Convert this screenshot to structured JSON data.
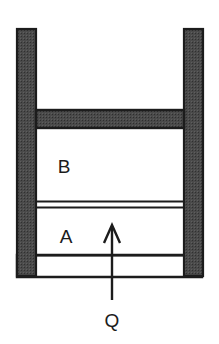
{
  "figure": {
    "background_color": "#ffffff",
    "wall_fill_color": "#4a4a4a",
    "wall_stroke_color": "#1c1c1c",
    "line_color": "#1c1c1c",
    "chamber_fill_color": "#ffffff"
  },
  "labels": {
    "chamber_upper": "B",
    "chamber_lower": "A",
    "heat_input": "Q"
  },
  "geometry": {
    "cylinder": {
      "left_wall_x": 17,
      "left_wall_width": 19,
      "right_wall_x": 184,
      "right_wall_width": 19,
      "wall_top_y": 29,
      "wall_bottom_y": 277,
      "base_top_y": 255,
      "base_bottom_y": 277
    },
    "piston_bar": {
      "top_y": 110,
      "bottom_y": 128
    },
    "divider_line": {
      "upper_y": 201,
      "lower_y": 208
    },
    "arrow": {
      "x": 112,
      "tip_y": 225,
      "tail_y": 300
    }
  },
  "label_positions": {
    "chamber_upper": {
      "x": 64,
      "y": 173
    },
    "chamber_lower": {
      "x": 66,
      "y": 243
    },
    "heat_input": {
      "x": 112,
      "y": 327
    }
  }
}
